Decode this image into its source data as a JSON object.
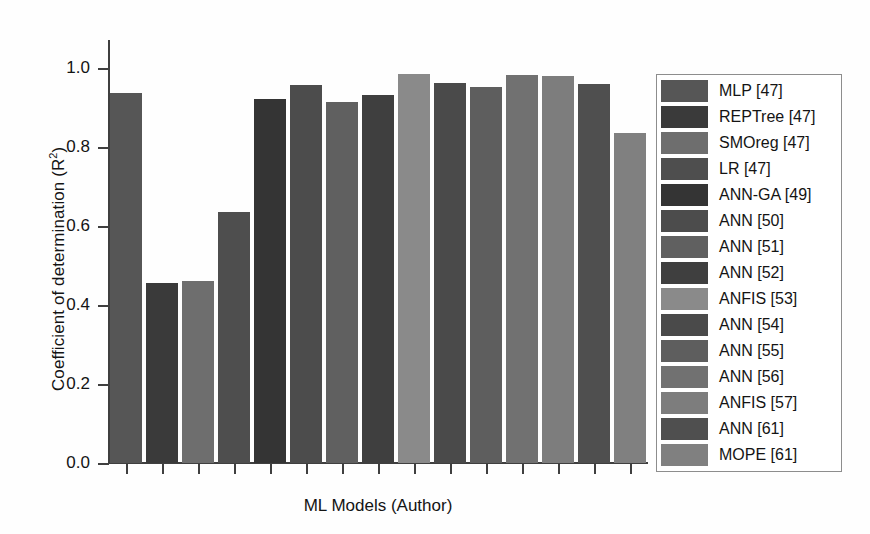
{
  "chart_data": {
    "type": "bar",
    "title": "",
    "xlabel": "ML Models (Author)",
    "ylabel": "Coefficient of determination (R²)",
    "ylabel_base": "Coefficient of determination (R",
    "ylabel_sup": "2",
    "ylabel_tail": ")",
    "ylim": [
      0.0,
      1.0
    ],
    "yticks": [
      "0.0",
      "0.2",
      "0.4",
      "0.6",
      "0.8",
      "1.0"
    ],
    "ytick_values": [
      0.0,
      0.2,
      0.4,
      0.6,
      0.8,
      1.0
    ],
    "xticklabels": [],
    "grid": false,
    "legend_position": "right",
    "categories": [
      "MLP [47]",
      "REPTree [47]",
      "SMOreg [47]",
      "LR [47]",
      "ANN-GA [49]",
      "ANN [50]",
      "ANN [51]",
      "ANN [52]",
      "ANFIS [53]",
      "ANN [54]",
      "ANN [55]",
      "ANN [56]",
      "ANFIS [57]",
      "ANN [61]",
      "MOPE [61]"
    ],
    "values": [
      0.937,
      0.455,
      0.462,
      0.635,
      0.922,
      0.958,
      0.914,
      0.931,
      0.984,
      0.963,
      0.952,
      0.982,
      0.979,
      0.959,
      0.835
    ],
    "colors": [
      "#565656",
      "#3a3a3a",
      "#6e6e6e",
      "#4e4e4e",
      "#343434",
      "#4c4c4c",
      "#606060",
      "#3f3f3f",
      "#8a8a8a",
      "#4a4a4a",
      "#5e5e5e",
      "#717171",
      "#7d7d7d",
      "#4f4f4f",
      "#808080"
    ]
  },
  "legend": {
    "items": [
      {
        "label": "MLP [47]",
        "color": "#565656"
      },
      {
        "label": "REPTree [47]",
        "color": "#3a3a3a"
      },
      {
        "label": "SMOreg [47]",
        "color": "#6e6e6e"
      },
      {
        "label": "LR [47]",
        "color": "#4e4e4e"
      },
      {
        "label": "ANN-GA [49]",
        "color": "#343434"
      },
      {
        "label": "ANN [50]",
        "color": "#4c4c4c"
      },
      {
        "label": "ANN [51]",
        "color": "#606060"
      },
      {
        "label": "ANN [52]",
        "color": "#3f3f3f"
      },
      {
        "label": "ANFIS [53]",
        "color": "#8a8a8a"
      },
      {
        "label": "ANN [54]",
        "color": "#4a4a4a"
      },
      {
        "label": "ANN [55]",
        "color": "#5e5e5e"
      },
      {
        "label": "ANN [56]",
        "color": "#717171"
      },
      {
        "label": "ANFIS [57]",
        "color": "#7d7d7d"
      },
      {
        "label": "ANN [61]",
        "color": "#4f4f4f"
      },
      {
        "label": "MOPE [61]",
        "color": "#808080"
      }
    ]
  },
  "axis_color": "#3f3f3f",
  "background": "#fefefe"
}
